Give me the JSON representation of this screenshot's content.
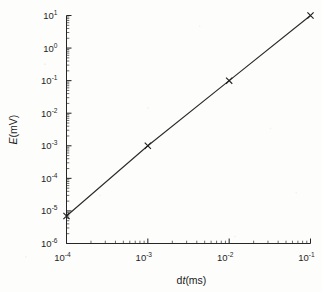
{
  "figure": {
    "background_color": "#fdfdfc",
    "ink_color": "#262626"
  },
  "chart_data": {
    "type": "line",
    "title": "",
    "subtitle": "",
    "xlabel": "dt(ms)",
    "xlabel_parts": {
      "prefix": "d",
      "italic": "t",
      "suffix": "(ms)"
    },
    "ylabel": "E(mV)",
    "ylabel_parts": {
      "italic": "E",
      "suffix": "(mV)"
    },
    "xscale": "log",
    "yscale": "log",
    "xlim": [
      0.0001,
      0.1
    ],
    "ylim": [
      1e-06,
      10
    ],
    "grid": false,
    "legend": "none",
    "minor_ticks": true,
    "tick_direction": "in",
    "marker": "x",
    "x": [
      0.0001,
      0.001,
      0.01,
      0.1
    ],
    "values": [
      7e-06,
      0.001,
      0.1,
      10
    ],
    "series": [
      {
        "name": "E",
        "x": [
          0.0001,
          0.001,
          0.01,
          0.1
        ],
        "values": [
          7e-06,
          0.001,
          0.1,
          10
        ]
      }
    ],
    "xticks": [
      {
        "value": 0.0001,
        "mantissa": "10",
        "exponent": "-4"
      },
      {
        "value": 0.001,
        "mantissa": "10",
        "exponent": "-3"
      },
      {
        "value": 0.01,
        "mantissa": "10",
        "exponent": "-2"
      },
      {
        "value": 0.1,
        "mantissa": "10",
        "exponent": "-1"
      }
    ],
    "yticks": [
      {
        "value": 10,
        "mantissa": "10",
        "exponent": "1"
      },
      {
        "value": 1,
        "mantissa": "10",
        "exponent": "0"
      },
      {
        "value": 0.1,
        "mantissa": "10",
        "exponent": "-1"
      },
      {
        "value": 0.01,
        "mantissa": "10",
        "exponent": "-2"
      },
      {
        "value": 0.001,
        "mantissa": "10",
        "exponent": "-3"
      },
      {
        "value": 0.0001,
        "mantissa": "10",
        "exponent": "-4"
      },
      {
        "value": 1e-05,
        "mantissa": "10",
        "exponent": "-5"
      },
      {
        "value": 1e-06,
        "mantissa": "10",
        "exponent": "-6"
      }
    ]
  }
}
